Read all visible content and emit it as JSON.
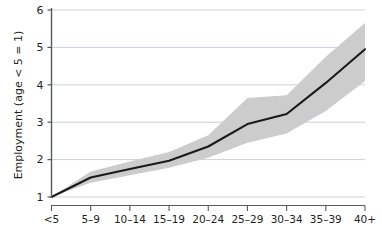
{
  "chart_data": {
    "type": "line",
    "title": "",
    "subtitle": "",
    "xlabel": "",
    "ylabel": "Employment (age < 5 = 1)",
    "categories": [
      "<5",
      "5–9",
      "10–14",
      "15–19",
      "20–24",
      "25–29",
      "30–34",
      "35–39",
      "40+"
    ],
    "values": [
      1.0,
      1.52,
      1.75,
      1.97,
      2.35,
      2.95,
      3.22,
      4.05,
      4.95
    ],
    "ci_lower": [
      1.0,
      1.38,
      1.58,
      1.78,
      2.05,
      2.45,
      2.7,
      3.3,
      4.1
    ],
    "ci_upper": [
      1.0,
      1.68,
      1.95,
      2.2,
      2.65,
      3.65,
      3.72,
      4.75,
      5.65
    ],
    "series": [
      {
        "name": "Employment (age < 5 = 1)",
        "values": [
          1.0,
          1.52,
          1.75,
          1.97,
          2.35,
          2.95,
          3.22,
          4.05,
          4.95
        ]
      }
    ],
    "ylim": [
      1,
      6
    ],
    "yticks": [
      1,
      2,
      3,
      4,
      5,
      6
    ],
    "ytick_labels": [
      "1",
      "2",
      "3",
      "4",
      "5",
      "6"
    ],
    "xtick_labels": [
      "<5",
      "5–9",
      "10–14",
      "15–19",
      "20–24",
      "25–29",
      "30–34",
      "35–39",
      "40+"
    ],
    "grid": true,
    "grid_axis": "y",
    "legend": false,
    "legend_position": "none",
    "line_color": "#1a1a1a",
    "band_color": "#cccccc",
    "grid_color": "#bfc4d4",
    "axis_color": "#58595b",
    "background_color": "#ffffff",
    "annotations": []
  },
  "axes": {
    "y_axis_title": "Employment (age < 5 = 1)",
    "x_axis_title": ""
  }
}
